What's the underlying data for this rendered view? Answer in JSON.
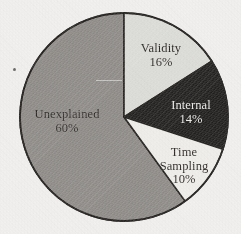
{
  "chart_data": {
    "type": "pie",
    "title": "",
    "subtitle": "",
    "xlabel": "",
    "ylabel": "",
    "legend_position": "none",
    "labels_inside_slices": true,
    "start_angle_deg": 0,
    "direction": "clockwise",
    "categories": [
      "Validity",
      "Internal",
      "Time Sampling",
      "Unexplained"
    ],
    "values": [
      16,
      14,
      10,
      60
    ],
    "value_unit": "%",
    "slices": [
      {
        "name": "Validity",
        "label": "Validity",
        "value": 16,
        "percent_text": "16%",
        "color": "#dededa",
        "text_color": "#231f1d",
        "start_deg": 0,
        "end_deg": 57.6
      },
      {
        "name": "Internal",
        "label": "Internal",
        "value": 14,
        "percent_text": "14%",
        "color": "#1b1917",
        "text_color": "#f2f0ec",
        "start_deg": 57.6,
        "end_deg": 108.0
      },
      {
        "name": "Time Sampling",
        "label": "Time\nSampling",
        "label_line1": "Time",
        "label_line2": "Sampling",
        "value": 10,
        "percent_text": "10%",
        "color": "#f3f1ed",
        "text_color": "#231f1d",
        "start_deg": 108.0,
        "end_deg": 144.0
      },
      {
        "name": "Unexplained",
        "label": "Unexplained",
        "value": 60,
        "percent_text": "60%",
        "color": "#8d8a86",
        "text_color": "#231f1d",
        "start_deg": 144.0,
        "end_deg": 360.0
      }
    ],
    "geometry": {
      "center_x": 124,
      "center_y": 117,
      "radius": 104
    },
    "style": {
      "background": "#f4f3f1",
      "outline_color": "#1d1a18",
      "outline_width": 1.6
    }
  }
}
